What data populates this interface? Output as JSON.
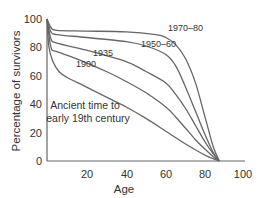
{
  "chart_data": {
    "type": "line",
    "title": "",
    "xlabel": "Age",
    "ylabel": "Percentage of survivors",
    "xlim": [
      0,
      100
    ],
    "ylim": [
      0,
      100
    ],
    "xticks": [
      20,
      40,
      60,
      80,
      100
    ],
    "yticks": [
      0,
      20,
      40,
      60,
      80,
      100
    ],
    "grid": false,
    "legend_position": "inline labels",
    "series": [
      {
        "name": "1970–80",
        "x": [
          0,
          2,
          5,
          20,
          40,
          55,
          60,
          65,
          70,
          75,
          80,
          84,
          87
        ],
        "values": [
          100,
          94,
          92,
          91.5,
          91,
          89,
          87,
          82,
          72,
          55,
          30,
          10,
          0
        ]
      },
      {
        "name": "1950–60",
        "x": [
          0,
          2,
          5,
          20,
          40,
          50,
          60,
          65,
          70,
          75,
          80,
          84,
          87
        ],
        "values": [
          100,
          91,
          89,
          87,
          84,
          81,
          75,
          67,
          52,
          35,
          18,
          6,
          0
        ]
      },
      {
        "name": "1935",
        "x": [
          0,
          2,
          5,
          20,
          40,
          50,
          60,
          65,
          70,
          75,
          80,
          84,
          87
        ],
        "values": [
          100,
          86,
          83,
          78,
          70,
          63,
          55,
          47,
          37,
          25,
          13,
          5,
          0
        ]
      },
      {
        "name": "1900",
        "x": [
          0,
          2,
          5,
          15,
          30,
          40,
          50,
          60,
          65,
          70,
          75,
          80,
          84,
          87
        ],
        "values": [
          100,
          80,
          77,
          72,
          63,
          56,
          48,
          38,
          31,
          23,
          15,
          8,
          3,
          0
        ]
      },
      {
        "name": "Ancient time to early 19th century",
        "x": [
          0,
          1,
          3,
          6,
          10,
          20,
          30,
          40,
          50,
          60,
          70,
          80,
          87
        ],
        "values": [
          100,
          80,
          70,
          63,
          59,
          52,
          45,
          38,
          30,
          21,
          12,
          4,
          0
        ]
      }
    ],
    "annotations": [
      {
        "text": "1970–80",
        "x": 67,
        "y": 94
      },
      {
        "text": "1950–60",
        "x": 52,
        "y": 84
      },
      {
        "text": "1935",
        "x": 37,
        "y": 75
      },
      {
        "text": "1900",
        "x": 25,
        "y": 69
      },
      {
        "text": "Ancient time to",
        "x": 14,
        "y": 39
      },
      {
        "text": "early 19th century",
        "x": 14,
        "y": 32
      }
    ]
  },
  "labels": {
    "xlabel": "Age",
    "ylabel": "Percentage of survivors",
    "ann_1970": "1970–80",
    "ann_1950": "1950–60",
    "ann_1935": "1935",
    "ann_1900": "1900",
    "ann_ancient_1": "Ancient time to",
    "ann_ancient_2": "early 19th century",
    "xt": [
      "20",
      "40",
      "60",
      "80",
      "100"
    ],
    "yt": [
      "0",
      "20",
      "40",
      "60",
      "80",
      "100"
    ]
  }
}
